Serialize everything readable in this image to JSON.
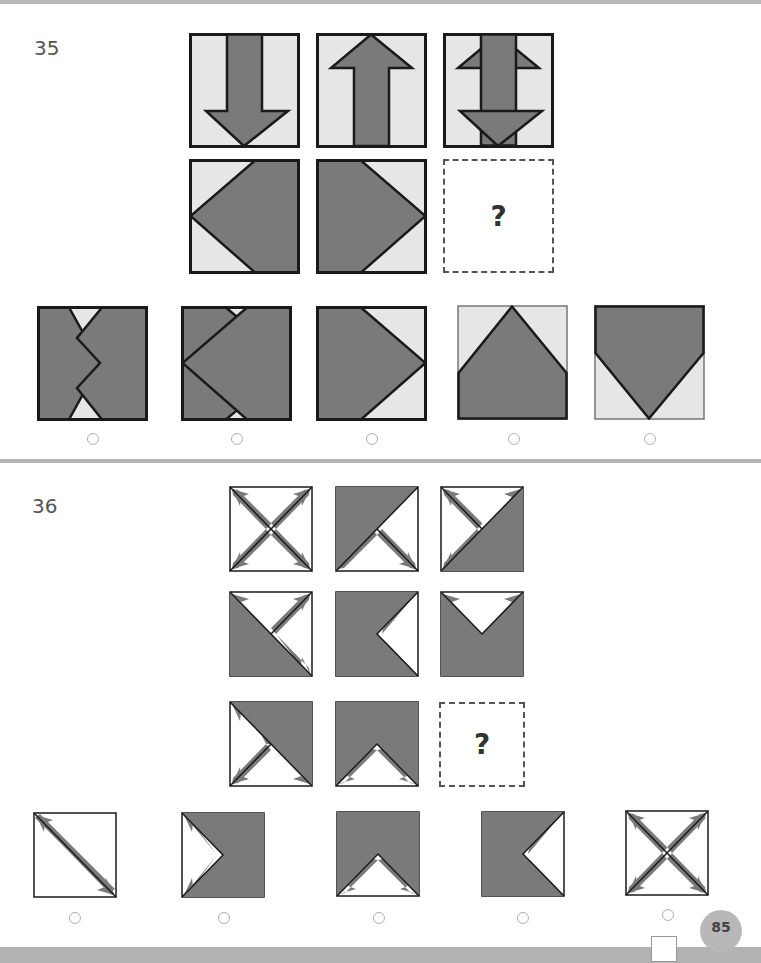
{
  "page": {
    "number": "85"
  },
  "colors": {
    "shape_fill": "#7a7a7a",
    "tile_bg_35": "#e6e6e6",
    "tile_bg_36": "#ffffff",
    "stroke": "#1a1a1a",
    "bars": "#b3b3b3"
  },
  "question35": {
    "number": "35",
    "placeholder": "?",
    "matrix": [
      [
        "arrow-down",
        "arrow-up",
        "arrow-down-up-overlay"
      ],
      [
        "pentagon-left",
        "pentagon-right",
        "missing"
      ]
    ],
    "options": [
      {
        "id": 1,
        "shape": "two-pentagons-overlap-inward",
        "selected": false
      },
      {
        "id": 2,
        "shape": "pentagon-left-overlap",
        "selected": false
      },
      {
        "id": 3,
        "shape": "pentagon-right",
        "selected": false
      },
      {
        "id": 4,
        "shape": "pentagon-up",
        "selected": false
      },
      {
        "id": 5,
        "shape": "pentagon-down",
        "selected": false
      }
    ]
  },
  "question36": {
    "number": "36",
    "placeholder": "?",
    "matrix": [
      [
        "x-arrows-four",
        "shaded-top-left-arrows",
        "shaded-bottom-right-arrows-up"
      ],
      [
        "shaded-bottom-left-arrows",
        "shaded-left-arrows-right",
        "shaded-bottom-arrows-up"
      ],
      [
        "shaded-top-right-arrows",
        "shaded-top-arrows-down",
        "missing"
      ]
    ],
    "options": [
      {
        "id": 1,
        "shape": "single-diagonal-arrow",
        "selected": false
      },
      {
        "id": 2,
        "shape": "shaded-right-arrows-left",
        "selected": false
      },
      {
        "id": 3,
        "shape": "shaded-top-arrows-down",
        "selected": false
      },
      {
        "id": 4,
        "shape": "shaded-left-arrows-right",
        "selected": false
      },
      {
        "id": 5,
        "shape": "x-arrows-four",
        "selected": false
      }
    ]
  }
}
